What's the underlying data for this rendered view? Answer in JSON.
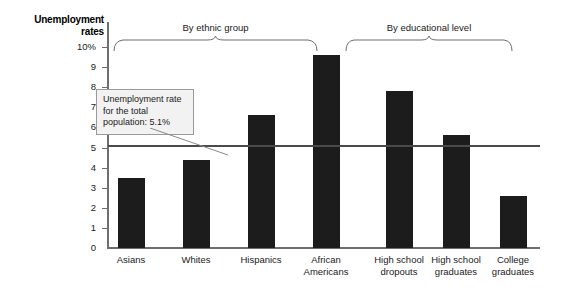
{
  "chart": {
    "type": "bar",
    "y_axis_title_line1": "Unemployment",
    "y_axis_title_line2": "rates",
    "bar_color": "#1c1c1c",
    "reference_line_color": "#4a4a4a",
    "axis_color": "#6e6e6e"
  },
  "callout": {
    "text": "Unemployment rate for the total population: 5.1%"
  },
  "groups": [
    {
      "label": "By ethnic group"
    },
    {
      "label": "By educational level"
    }
  ],
  "chart_data": {
    "type": "bar",
    "title": "Unemployment rates",
    "xlabel": "",
    "ylabel": "Unemployment rates",
    "ylim": [
      0,
      10
    ],
    "ytick_labels": [
      "10%",
      "9",
      "8",
      "7",
      "6",
      "5",
      "4",
      "3",
      "2",
      "1",
      "0"
    ],
    "ytick_values": [
      10,
      9,
      8,
      7,
      6,
      5,
      4,
      3,
      2,
      1,
      0
    ],
    "grid": false,
    "legend": "none",
    "categories": [
      "Asians",
      "Whites",
      "Hispanics",
      "African Americans",
      "High school dropouts",
      "High school graduates",
      "College graduates"
    ],
    "category_lines": [
      [
        "Asians"
      ],
      [
        "Whites"
      ],
      [
        "Hispanics"
      ],
      [
        "African",
        "Americans"
      ],
      [
        "High school",
        "dropouts"
      ],
      [
        "High school",
        "graduates"
      ],
      [
        "College",
        "graduates"
      ]
    ],
    "values": [
      3.5,
      4.4,
      6.6,
      9.6,
      7.8,
      5.6,
      2.6
    ],
    "groups": [
      {
        "label": "By ethnic group",
        "categories": [
          "Asians",
          "Whites",
          "Hispanics",
          "African Americans"
        ]
      },
      {
        "label": "By educational level",
        "categories": [
          "High school dropouts",
          "High school graduates",
          "College graduates"
        ]
      }
    ],
    "annotations": [
      {
        "type": "reference_line",
        "orientation": "horizontal",
        "value": 5.1,
        "label": "Unemployment rate for the total population: 5.1%"
      }
    ]
  }
}
